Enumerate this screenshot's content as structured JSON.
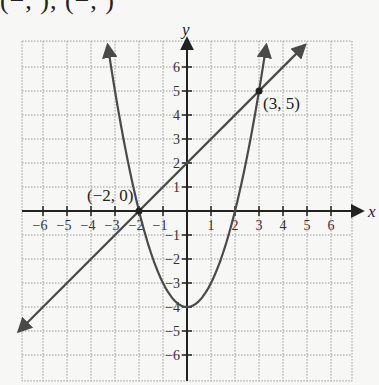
{
  "header_fragment": "(−, ), (−, )",
  "chart_data": {
    "type": "line",
    "title": "",
    "xlabel": "x",
    "ylabel": "y",
    "xlim": [
      -6.875,
      6.875
    ],
    "ylim": [
      -7.08,
      7.08
    ],
    "grid": true,
    "x_ticks": [
      -6,
      -5,
      -4,
      -3,
      -2,
      -1,
      1,
      2,
      3,
      4,
      5,
      6
    ],
    "y_ticks": [
      -6,
      -5,
      -4,
      -3,
      -2,
      -1,
      1,
      2,
      3,
      4,
      5,
      6
    ],
    "x_tick_labels": [
      "−6",
      "−5",
      "−4",
      "−3",
      "−2",
      "−1",
      "1",
      "2",
      "3",
      "4",
      "5",
      "6"
    ],
    "y_tick_labels": [
      "−6",
      "−5",
      "−4",
      "−3",
      "−2",
      "−1",
      "1",
      "2",
      "3",
      "4",
      "5",
      "6"
    ],
    "series": [
      {
        "name": "parabola",
        "equation": "y = x^2 - 4",
        "x_range": [
          -3.3,
          3.3
        ],
        "vertex": [
          0,
          -4
        ]
      },
      {
        "name": "line",
        "equation": "y = x + 2",
        "x_range": [
          -7,
          4.9
        ]
      }
    ],
    "points": [
      {
        "x": -2,
        "y": 0,
        "label": "(−2, 0)"
      },
      {
        "x": 3,
        "y": 5,
        "label": "(3, 5)"
      }
    ],
    "colors": {
      "curve": "#4a4a4a",
      "axis": "#222222",
      "grid": "#9a9a9a",
      "background": "#f7f7f5"
    }
  }
}
